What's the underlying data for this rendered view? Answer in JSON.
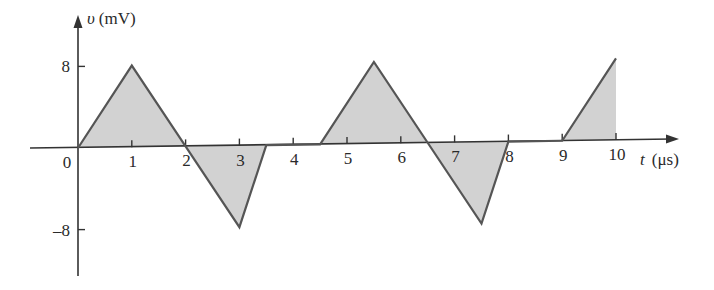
{
  "chart_data": {
    "type": "line",
    "title": "",
    "xlabel": "t (μs)",
    "ylabel": "υ (mV)",
    "ylabel_var": "υ",
    "ylabel_unit": "(mV)",
    "xlabel_var": "t",
    "xlabel_unit": "(μs)",
    "xlim": [
      0,
      10
    ],
    "ylim": [
      -8,
      8
    ],
    "x_ticks": [
      "0",
      "1",
      "2",
      "3",
      "4",
      "5",
      "6",
      "7",
      "8",
      "9",
      "10"
    ],
    "y_ticks": [
      "8",
      "-8"
    ],
    "y_tick_labels": [
      "8",
      "–8"
    ],
    "grid": false,
    "fill": "shaded area under curve",
    "series": [
      {
        "name": "v(t)",
        "x": [
          0,
          1,
          2,
          3,
          3.5,
          4.5,
          5.5,
          6.5,
          7.5,
          8,
          9,
          10
        ],
        "y": [
          0,
          8,
          0,
          -8,
          0,
          0,
          8,
          0,
          -8,
          0,
          0,
          8
        ]
      }
    ]
  },
  "colors": {
    "line": "#555555",
    "fill": "#d2d2d2",
    "axis": "#333333",
    "text": "#2a2a2a"
  }
}
